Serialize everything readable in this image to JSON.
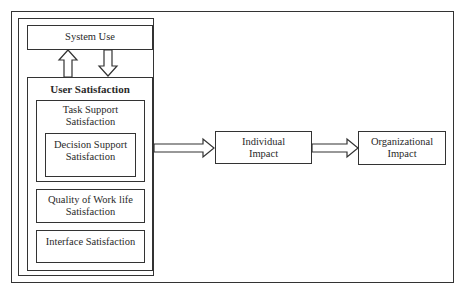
{
  "diagram": {
    "system_use": {
      "label": "System Use"
    },
    "user_satisfaction": {
      "title": "User Satisfaction",
      "task_support": {
        "line1": "Task Support",
        "line2": "Satisfaction"
      },
      "decision_support": {
        "line1": "Decision Support",
        "line2": "Satisfaction"
      },
      "quality_of_work_life": {
        "line1": "Quality of Work life",
        "line2": "Satisfaction"
      },
      "interface": {
        "label": "Interface Satisfaction"
      }
    },
    "individual_impact": {
      "line1": "Individual",
      "line2": "Impact"
    },
    "organizational_impact": {
      "line1": "Organizational",
      "line2": "Impact"
    },
    "colors": {
      "stroke": "#333333",
      "background": "#ffffff"
    }
  }
}
